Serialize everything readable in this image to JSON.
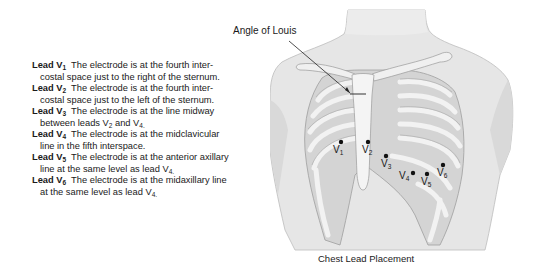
{
  "leads": [
    {
      "name": "Lead V",
      "sub": "1",
      "line1": "The electrode is at the fourth inter-",
      "line2": "costal space just to the right of the sternum.",
      "line2_sub": "",
      "line2_end": ""
    },
    {
      "name": "Lead V",
      "sub": "2",
      "line1": "The electrode is at the fourth inter-",
      "line2": "costal space just to the left of the sternum.",
      "line2_sub": "",
      "line2_end": ""
    },
    {
      "name": "Lead V",
      "sub": "3",
      "line1": "The electrode is at the line midway",
      "line2": "between leads V",
      "line2_sub": "2",
      "line2_end": " and V",
      "line2_sub2": "4."
    },
    {
      "name": "Lead V",
      "sub": "4",
      "line1": "The electrode is at the midclavicular",
      "line2": "line in the fifth interspace.",
      "line2_sub": "",
      "line2_end": ""
    },
    {
      "name": "Lead V",
      "sub": "5",
      "line1": "The electrode is at the anterior axillary",
      "line2": "line at the same level as lead V",
      "line2_sub": "4.",
      "line2_end": ""
    },
    {
      "name": "Lead V",
      "sub": "6",
      "line1": "The electrode is at the midaxillary line",
      "line2": "at the same level as lead V",
      "line2_sub": "4.",
      "line2_end": ""
    }
  ],
  "figure": {
    "angle_label": "Angle of Louis",
    "caption": "Chest Lead Placement",
    "electrodes": [
      {
        "label": "V",
        "sub": "1"
      },
      {
        "label": "V",
        "sub": "2"
      },
      {
        "label": "V",
        "sub": "3"
      },
      {
        "label": "V",
        "sub": "4"
      },
      {
        "label": "V",
        "sub": "5"
      },
      {
        "label": "V",
        "sub": "6"
      }
    ]
  }
}
